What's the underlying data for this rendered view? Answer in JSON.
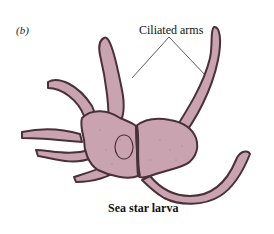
{
  "figure": {
    "panel_label": "(b)",
    "callout_label": "Ciliated arms",
    "caption": "Sea star larva",
    "colors": {
      "body_fill": "#c9a3b0",
      "outline": "#4a3038",
      "stipple": "#8a6a74",
      "callout_line": "#333333"
    }
  }
}
